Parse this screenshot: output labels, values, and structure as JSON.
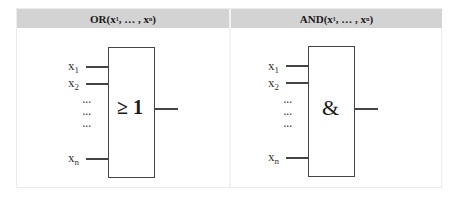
{
  "table": {
    "columns": [
      {
        "header": {
          "prefix": "OR(x",
          "sub1": "1",
          "mid": ", … , x",
          "sub2": "n",
          "suffix": ")"
        },
        "gate": {
          "type": "OR",
          "symbol": "≥ 1",
          "inputs": [
            {
              "name": "x",
              "sub": "1"
            },
            {
              "name": "x",
              "sub": "2"
            },
            {
              "name": "x",
              "sub": "n"
            }
          ],
          "ellipsis": [
            "···",
            "···",
            "···"
          ]
        }
      },
      {
        "header": {
          "prefix": "AND(x",
          "sub1": "1",
          "mid": ", … , x",
          "sub2": "n",
          "suffix": ")"
        },
        "gate": {
          "type": "AND",
          "symbol": "&",
          "inputs": [
            {
              "name": "x",
              "sub": "1"
            },
            {
              "name": "x",
              "sub": "2"
            },
            {
              "name": "x",
              "sub": "n"
            }
          ],
          "ellipsis": [
            "···",
            "···",
            "···"
          ]
        }
      }
    ]
  },
  "colors": {
    "header_bg": "#d3d3d3",
    "stroke": "#444444",
    "background": "#ffffff"
  }
}
